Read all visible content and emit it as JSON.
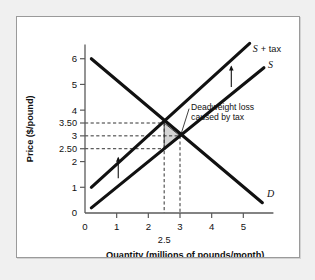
{
  "chart_data": {
    "type": "line",
    "title": "",
    "xlabel": "Quantity (millions of pounds/month)",
    "ylabel": "Price ($/pound)",
    "xlim": [
      0,
      6
    ],
    "ylim": [
      0,
      7
    ],
    "grid": false,
    "legend_position": "inline-curve-labels",
    "x_ticks": [
      "0",
      "1",
      "2",
      "3",
      "4",
      "5"
    ],
    "x_tick_values": [
      0,
      1,
      2,
      3,
      4,
      5
    ],
    "x_extra_tick": "2.5",
    "x_extra_tick_value": 2.5,
    "y_ticks": [
      "1",
      "2",
      "2.50",
      "3",
      "3.50",
      "4",
      "5",
      "6"
    ],
    "y_tick_values": [
      1,
      2,
      2.5,
      3,
      3.5,
      4,
      5,
      6
    ],
    "y_origin_tick": "0",
    "series": [
      {
        "name": "D",
        "label": "D",
        "type": "line",
        "x": [
          0.2,
          5.6
        ],
        "y": [
          6.0,
          0.4
        ]
      },
      {
        "name": "S",
        "label": "S",
        "type": "line",
        "x": [
          0.2,
          5.65
        ],
        "y": [
          0.2,
          5.65
        ]
      },
      {
        "name": "S + tax",
        "label_italic": "S",
        "label_plain": "+ tax",
        "type": "line",
        "x": [
          0.2,
          5.2
        ],
        "y": [
          1.0,
          6.6
        ]
      }
    ],
    "points": [
      {
        "name": "equilibrium-with-tax",
        "x": 2.5,
        "y": 3.5
      },
      {
        "name": "equilibrium-no-tax",
        "x": 3.0,
        "y": 3.0
      },
      {
        "name": "supply-price-with-tax",
        "x": 2.5,
        "y": 2.5
      }
    ],
    "guides": {
      "horizontal_values": [
        3.5,
        3.0,
        2.5
      ],
      "vertical_values": [
        2.5,
        3.0
      ]
    },
    "shaded_region": {
      "name": "deadweight-loss-triangle",
      "vertices": [
        [
          2.5,
          3.5
        ],
        [
          2.5,
          2.5
        ],
        [
          3.0,
          3.0
        ]
      ],
      "fill": "#d5d5d5"
    },
    "annotations": [
      {
        "name": "deadweight-loss-annotation",
        "line1": "Deadweight loss",
        "line2": "caused by tax",
        "points_to": [
          3.0,
          3.0
        ]
      }
    ],
    "shift_arrows": [
      {
        "name": "supply-shift-arrow-left",
        "x": 1.05,
        "y_from": 1.35,
        "y_to": 2.15
      },
      {
        "name": "supply-shift-arrow-right",
        "x": 4.62,
        "y_from": 4.9,
        "y_to": 5.7
      }
    ]
  },
  "colors": {
    "curve": "#111111",
    "axis": "#5a5a5a",
    "shade": "#d5d5d5",
    "page_background": "#f0f0f0",
    "panel_background": "#ffffff",
    "panel_border": "#9a9a9a"
  }
}
